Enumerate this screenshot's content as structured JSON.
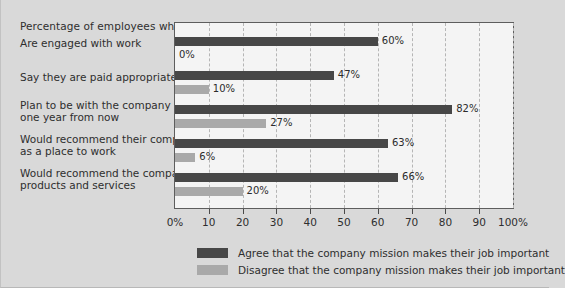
{
  "chart_data": {
    "type": "bar",
    "orientation": "horizontal",
    "title": "Percentage of employees who:",
    "xlabel": "",
    "ylabel": "",
    "xlim": [
      0,
      100
    ],
    "grid": true,
    "grid_style": "dashed vertical",
    "legend_position": "bottom",
    "categories": [
      "Are engaged with work",
      "Say they are paid appropriately",
      "Plan to be with the company\none year from now",
      "Would recommend their company\nas a place to work",
      "Would recommend the company's\nproducts and services"
    ],
    "series": [
      {
        "name": "Agree that the company mission makes their job important",
        "color": "#474747",
        "values": [
          60,
          47,
          82,
          63,
          66
        ],
        "labels": [
          "60%",
          "47%",
          "82%",
          "63%",
          "66%"
        ]
      },
      {
        "name": "Disagree that the company mission makes their job important",
        "color": "#a9a9a9",
        "values": [
          0,
          10,
          27,
          6,
          20
        ],
        "labels": [
          "0%",
          "10%",
          "27%",
          "6%",
          "20%"
        ]
      }
    ],
    "xticks": [
      0,
      10,
      20,
      30,
      40,
      50,
      60,
      70,
      80,
      90,
      100
    ],
    "xticklabels": [
      "0%",
      "10",
      "20",
      "30",
      "40",
      "50",
      "60",
      "70",
      "80",
      "90",
      "100%"
    ]
  },
  "colors": {
    "page_background": "#d9d9d9",
    "plot_background": "#f4f4f4",
    "plot_border": "#5d5d5d",
    "gridline": "#b5b5b5",
    "agree": "#474747",
    "disagree": "#a9a9a9",
    "text": "#2e2e2e"
  }
}
